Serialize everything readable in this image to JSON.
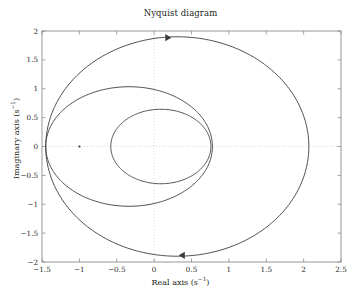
{
  "chart_data": {
    "type": "line",
    "title": "Nyquist diagram",
    "xlabel": "Real axis (s⁻¹)",
    "ylabel": "Imaginary axis (s⁻¹)",
    "xlim": [
      -1.5,
      2.5
    ],
    "ylim": [
      -2,
      2
    ],
    "xticks": [
      -1.5,
      -1,
      -0.5,
      0,
      0.5,
      1,
      1.5,
      2,
      2.5
    ],
    "xticklabels": [
      "−1.5",
      "−1",
      "−0.5",
      "0",
      "0.5",
      "1",
      "1.5",
      "2",
      "2.5"
    ],
    "yticks": [
      -2,
      -1.5,
      -1,
      -0.5,
      0,
      0.5,
      1,
      1.5,
      2
    ],
    "yticklabels": [
      "−2",
      "−1.5",
      "−1",
      "−0.5",
      "0",
      "0.5",
      "1",
      "1.5",
      "2"
    ],
    "grid": false,
    "zero_gridlines": true,
    "legend": null,
    "line_color": "#3c3c3c",
    "grid_color": "#c8c8c8",
    "frame_color": "#8c8c8c",
    "series": [
      {
        "name": "outer-loop",
        "description": "Outer Nyquist contour, crosses real axis near -1.45 and 2.07",
        "x_extent": [
          -1.45,
          2.07
        ],
        "y_extent": [
          -1.9,
          1.9
        ],
        "center": [
          0.31,
          0.0
        ],
        "rx": 1.76,
        "ry": 1.9,
        "tilt_deg": 0
      },
      {
        "name": "middle-loop",
        "description": "Middle Nyquist contour, crosses real axis near -1.45 and 0.78",
        "x_extent": [
          -1.45,
          0.78
        ],
        "y_extent": [
          -1.04,
          1.03
        ],
        "center": [
          -0.335,
          0.0
        ],
        "rx": 1.115,
        "ry": 1.035,
        "tilt_deg": 0
      },
      {
        "name": "inner-loop",
        "description": "Inner Nyquist contour, crosses real axis near -0.58 and 0.76",
        "x_extent": [
          -0.58,
          0.76
        ],
        "y_extent": [
          -0.65,
          0.64
        ],
        "center": [
          0.09,
          0.0
        ],
        "rx": 0.67,
        "ry": 0.645,
        "tilt_deg": 0
      }
    ],
    "markers": [
      {
        "name": "critical-point",
        "x": -1.0,
        "y": 0.0,
        "style": "dot",
        "size": 2
      }
    ],
    "annotations": [
      {
        "name": "arrow-top",
        "x": 0.23,
        "y": 1.885,
        "direction": "right"
      },
      {
        "name": "arrow-bottom",
        "x": 0.33,
        "y": -1.885,
        "direction": "left"
      }
    ]
  }
}
